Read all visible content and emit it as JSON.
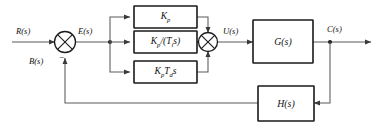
{
  "diagram": {
    "type": "control-block-diagram",
    "colors": {
      "block_stroke": "#1a1a1a",
      "wire": "#5a5a5a",
      "background": "#ffffff",
      "text": "#111111"
    },
    "signals": {
      "reference": "R(s)",
      "error": "E(s)",
      "feedback": "B(s)",
      "control": "U(s)",
      "output": "C(s)"
    },
    "blocks": [
      {
        "id": "proportional",
        "label_main": "K",
        "label_sub": "p",
        "label_tail": "",
        "label_plain": "Kp"
      },
      {
        "id": "integral",
        "label_plain": "Kp/(Tis)"
      },
      {
        "id": "derivative",
        "label_plain": "KpTds"
      },
      {
        "id": "plant",
        "label_plain": "G(s)"
      },
      {
        "id": "feedback",
        "label_plain": "H(s)"
      }
    ],
    "summing_junctions": [
      {
        "id": "error-junction",
        "inputs": [
          "R(s)",
          "B(s)"
        ],
        "signs": [
          "+",
          "-"
        ]
      },
      {
        "id": "control-junction",
        "inputs": [
          "proportional",
          "integral",
          "derivative"
        ],
        "signs": [
          "+",
          "+",
          "+"
        ]
      }
    ],
    "sign_minus": "−"
  }
}
